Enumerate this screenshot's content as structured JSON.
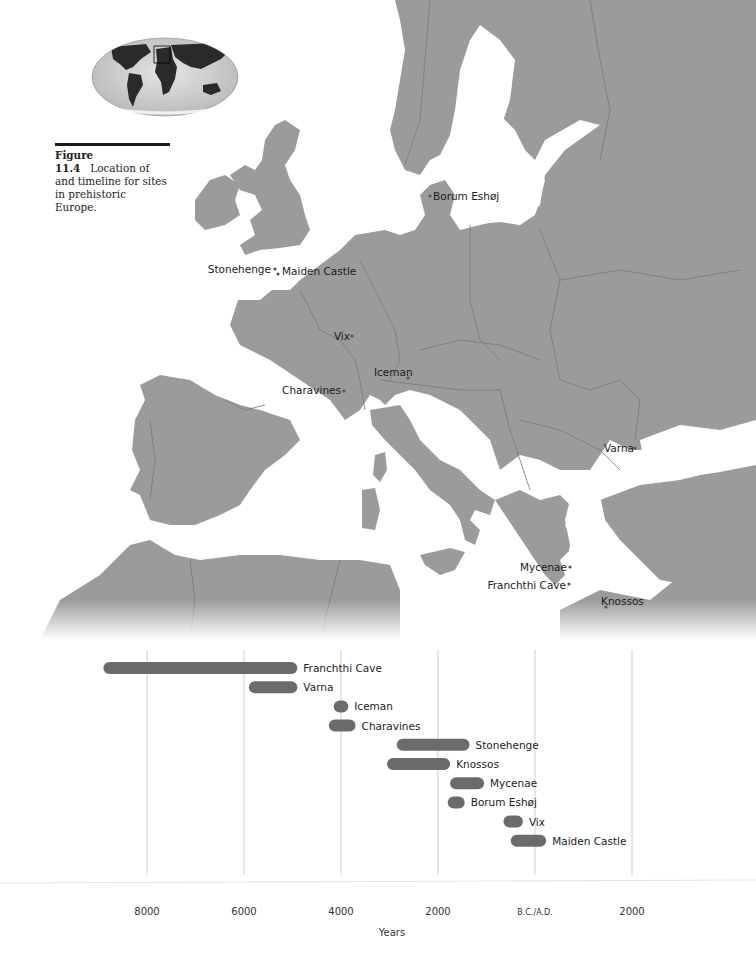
{
  "caption": {
    "figure_number": "Figure 11.4",
    "text": "Location of and timeline for sites in prehistoric Europe."
  },
  "map": {
    "title": "Map of Europe with prehistoric sites",
    "inset": "World locator map with Europe highlighted",
    "colors": {
      "land": "#9b9b9b",
      "sea": "#ffffff",
      "borders": "#777777",
      "globe_land": "#2a2a2a",
      "globe_ocean": "#c9c9c9"
    },
    "sites": [
      {
        "name": "Borum Eshøj"
      },
      {
        "name": "Stonehenge"
      },
      {
        "name": "Maiden Castle"
      },
      {
        "name": "Vix"
      },
      {
        "name": "Iceman"
      },
      {
        "name": "Charavines"
      },
      {
        "name": "Varna"
      },
      {
        "name": "Mycenae"
      },
      {
        "name": "Franchthi Cave"
      },
      {
        "name": "Knossos"
      }
    ]
  },
  "chart_data": {
    "type": "bar",
    "orientation": "horizontal-range",
    "title": "",
    "xlabel": "Years",
    "ylabel": "",
    "x_unit": "calendar years (negative = B.C., positive = A.D.)",
    "xlim": [
      -10000,
      3000
    ],
    "grid": true,
    "ticks": [
      {
        "value": -8000,
        "label": "8000"
      },
      {
        "value": -6000,
        "label": "6000"
      },
      {
        "value": -4000,
        "label": "4000"
      },
      {
        "value": -2000,
        "label": "2000"
      },
      {
        "value": 0,
        "label": "B.C./A.D."
      },
      {
        "value": 2000,
        "label": "2000"
      }
    ],
    "bar_color": "#6b6b6b",
    "series": [
      {
        "name": "Franchthi Cave",
        "start": -8900,
        "end": -4900
      },
      {
        "name": "Varna",
        "start": -5900,
        "end": -4900
      },
      {
        "name": "Iceman",
        "start": -4150,
        "end": -3850
      },
      {
        "name": "Charavines",
        "start": -4250,
        "end": -3700
      },
      {
        "name": "Stonehenge",
        "start": -2850,
        "end": -1350
      },
      {
        "name": "Knossos",
        "start": -3050,
        "end": -1750
      },
      {
        "name": "Mycenae",
        "start": -1750,
        "end": -1050
      },
      {
        "name": "Borum Eshøj",
        "start": -1800,
        "end": -1450
      },
      {
        "name": "Vix",
        "start": -650,
        "end": -250
      },
      {
        "name": "Maiden Castle",
        "start": -500,
        "end": 230
      }
    ]
  }
}
